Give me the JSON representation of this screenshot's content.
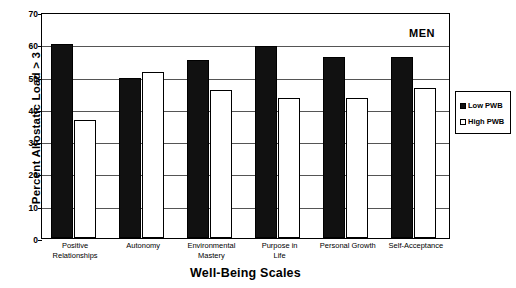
{
  "chart_data": {
    "type": "bar",
    "title": "",
    "annotation": "MEN",
    "xlabel": "Well-Being Scales",
    "ylabel": "Percent Allostatic Load > 3",
    "ylim": [
      0,
      70
    ],
    "yticks": [
      0,
      10,
      20,
      30,
      40,
      50,
      60,
      70
    ],
    "grid": true,
    "legend_position": "right",
    "categories": [
      "Positive Relationships",
      "Autonomy",
      "Environmental Mastery",
      "Purpose in Life",
      "Personal Growth",
      "Self-Acceptance"
    ],
    "category_lines": [
      [
        "Positive",
        "Relationships"
      ],
      [
        "Autonomy"
      ],
      [
        "Environmental",
        "Mastery"
      ],
      [
        "Purpose in",
        "Life"
      ],
      [
        "Personal Growth"
      ],
      [
        "Self-Acceptance"
      ]
    ],
    "series": [
      {
        "name": "Low PWB",
        "color": "#111111",
        "values": [
          60,
          49.5,
          55,
          59.5,
          56,
          56
        ]
      },
      {
        "name": "High PWB",
        "color": "#ffffff",
        "values": [
          36.5,
          51.5,
          46,
          43.5,
          43.5,
          46.5
        ]
      }
    ]
  },
  "legend": {
    "items": [
      {
        "label": "Low PWB",
        "swatch": "filled-square"
      },
      {
        "label": "High PWB",
        "swatch": "open-square"
      }
    ]
  },
  "colors": {
    "low_pwb": "#111111",
    "high_pwb": "#ffffff",
    "axis": "#000000",
    "gridline": "#555555",
    "background": "#ffffff"
  }
}
